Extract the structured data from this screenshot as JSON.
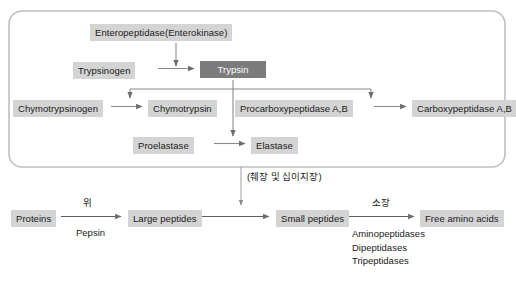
{
  "diagram": {
    "title_region": "Protein digestion enzyme activation cascade",
    "pancreas_box": {
      "nodes": [
        {
          "id": "enteropeptidase",
          "label": "Enteropeptidase(Enterokinase)",
          "style": "light"
        },
        {
          "id": "trypsinogen",
          "label": "Trypsinogen",
          "style": "light"
        },
        {
          "id": "trypsin",
          "label": "Trypsin",
          "style": "dark"
        },
        {
          "id": "chymotrypsinogen",
          "label": "Chymotrypsinogen",
          "style": "light"
        },
        {
          "id": "chymotrypsin",
          "label": "Chymotrypsin",
          "style": "light"
        },
        {
          "id": "procarboxypeptidase",
          "label": "Procarboxypeptidase A,B",
          "style": "light"
        },
        {
          "id": "carboxypeptidase",
          "label": "Carboxypeptidase A,B",
          "style": "light"
        },
        {
          "id": "proelastase",
          "label": "Proelastase",
          "style": "light"
        },
        {
          "id": "elastase",
          "label": "Elastase",
          "style": "light"
        }
      ]
    },
    "organ_annotation": "(췌장 및 십이지장)",
    "pathway": {
      "nodes": [
        {
          "id": "proteins",
          "label": "Proteins"
        },
        {
          "id": "large-peptides",
          "label": "Large peptides"
        },
        {
          "id": "small-peptides",
          "label": "Small peptides"
        },
        {
          "id": "free-amino-acids",
          "label": "Free amino acids"
        }
      ],
      "step1_organ": "위",
      "step1_enzyme": "Pepsin",
      "step3_organ": "소장",
      "step3_enzymes": [
        "Aminopeptidases",
        "Dipeptidases",
        "Tripeptidases"
      ]
    }
  },
  "colors": {
    "node_light": "#d4d4d4",
    "node_dark": "#7b7b7b",
    "line": "#8a8a8a",
    "text": "#1a1a1a",
    "text_inverse": "#ffffff",
    "panel_border": "#b9b9b9",
    "background": "#ffffff"
  }
}
